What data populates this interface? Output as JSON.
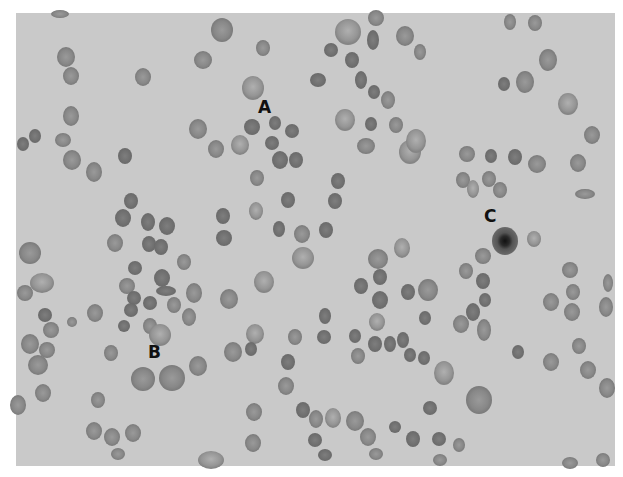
{
  "image": {
    "description": "Grayscale light micrograph of a blood smear showing red blood cells",
    "background_color": "#c9c9c9",
    "cell_color": "#8a8a8a",
    "cell_dark_color": "#6e6e6e",
    "labels": [
      {
        "text": "A",
        "x": 266,
        "y": 112
      },
      {
        "text": "B",
        "x": 155,
        "y": 358
      },
      {
        "text": "C",
        "x": 491,
        "y": 222
      }
    ]
  }
}
